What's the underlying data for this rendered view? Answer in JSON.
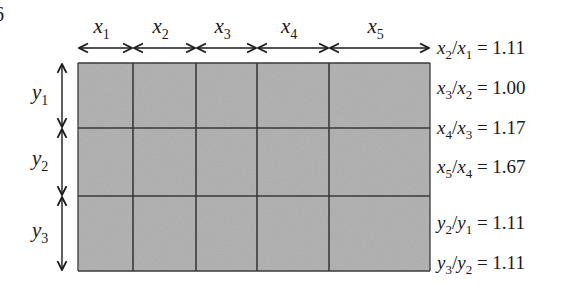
{
  "corner_fragment": "6",
  "grid": {
    "fill_color": "#a9a9a9",
    "line_color": "#3a3a3a",
    "left": 78,
    "top": 63,
    "right": 430,
    "bottom": 271,
    "column_edges": [
      78,
      133,
      196,
      257,
      329,
      430
    ],
    "row_edges": [
      63,
      128,
      196,
      271
    ]
  },
  "x_labels": [
    {
      "var": "x",
      "sub": "1"
    },
    {
      "var": "x",
      "sub": "2"
    },
    {
      "var": "x",
      "sub": "3"
    },
    {
      "var": "x",
      "sub": "4"
    },
    {
      "var": "x",
      "sub": "5"
    }
  ],
  "y_labels": [
    {
      "var": "y",
      "sub": "1"
    },
    {
      "var": "y",
      "sub": "2"
    },
    {
      "var": "y",
      "sub": "3"
    }
  ],
  "ratios": [
    {
      "num": "x",
      "num_sub": "2",
      "den": "x",
      "den_sub": "1",
      "value": "= 1.11",
      "top": 38
    },
    {
      "num": "x",
      "num_sub": "3",
      "den": "x",
      "den_sub": "2",
      "value": "= 1.00",
      "top": 78
    },
    {
      "num": "x",
      "num_sub": "4",
      "den": "x",
      "den_sub": "3",
      "value": "= 1.17",
      "top": 118
    },
    {
      "num": "x",
      "num_sub": "5",
      "den": "x",
      "den_sub": "4",
      "value": "= 1.67",
      "top": 157
    },
    {
      "num": "y",
      "num_sub": "2",
      "den": "y",
      "den_sub": "1",
      "value": "= 1.11",
      "top": 213
    },
    {
      "num": "y",
      "num_sub": "3",
      "den": "y",
      "den_sub": "2",
      "value": "= 1.11",
      "top": 253
    }
  ]
}
